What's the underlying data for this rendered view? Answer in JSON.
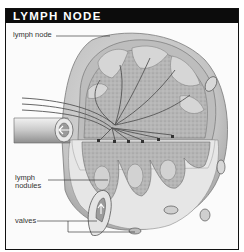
{
  "header": {
    "title": "LYMPH NODE"
  },
  "labels": {
    "lymph_node": "lymph node",
    "lymph_nodules_line1": "lymph",
    "lymph_nodules_line2": "nodules",
    "valves": "valves"
  },
  "colors": {
    "header_bg": "#0c0c0c",
    "header_text": "#ffffff",
    "capsule": "#c9c9c9",
    "cortex": "#a8a8a8",
    "medulla": "#d4d4d4",
    "background": "#fbfbfb"
  }
}
